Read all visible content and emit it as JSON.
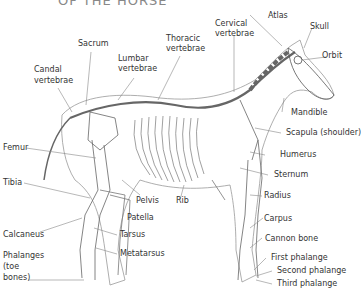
{
  "title": "OF THE HORSE",
  "labels": {
    "sacrum": "Sacrum",
    "lumbar1": "Lumbar",
    "lumbar2": "vertebrae",
    "thoracic1": "Thoracic",
    "thoracic2": "vertebrae",
    "cervical1": "Cervical",
    "cervical2": "vertebrae",
    "atlas": "Atlas",
    "skull": "Skull",
    "orbit": "Orbit",
    "candal1": "Candal",
    "candal2": "vertebrae",
    "mandible": "Mandible",
    "scapula": "Scapula (shoulder)",
    "femur": "Femur",
    "humerus": "Humerus",
    "sternum": "Sternum",
    "tibia": "Tibia",
    "pelvis": "Pelvis",
    "rib": "Rib",
    "radius": "Radius",
    "patella": "Patella",
    "carpus": "Carpus",
    "calcaneus": "Calcaneus",
    "tarsus": "Tarsus",
    "cannon": "Cannon bone",
    "metatarsus": "Metatarsus",
    "phal1": "Phalanges",
    "phal2": "(toe",
    "phal3": "bones)",
    "first_phalange": "First phalange",
    "second_phalange": "Second phalange",
    "third_phalange": "Third phalange"
  }
}
